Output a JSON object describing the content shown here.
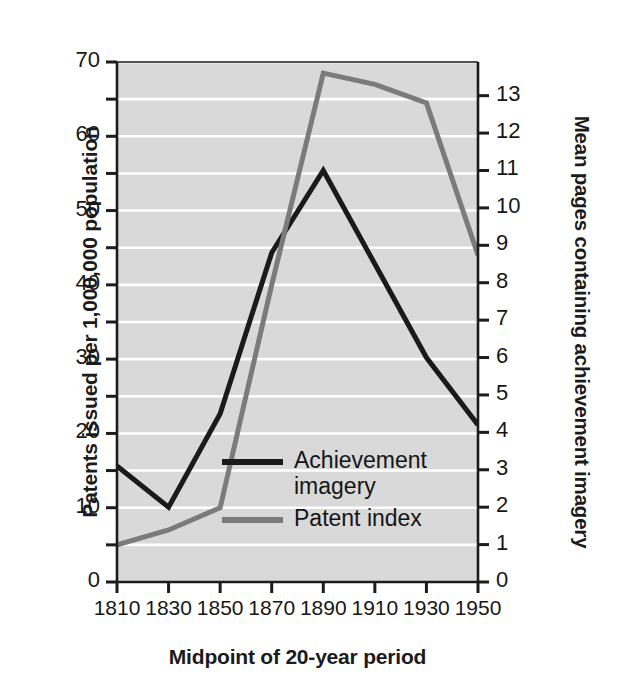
{
  "chart_data": {
    "type": "line",
    "title": "",
    "subtitle": "",
    "xlabel": "Midpoint of 20-year period",
    "ylabel": "Patents issued per 1,000,000 population",
    "y2label": "Mean pages containing achievement imagery",
    "grid": true,
    "grid_orientation": "horizontal",
    "legend_position": "inside-center-lower",
    "plot_background": "#d9d9d9",
    "gridline_color": "#ffffff",
    "x": [
      1810,
      1830,
      1850,
      1870,
      1890,
      1910,
      1930,
      1950
    ],
    "xtick_labels": [
      "1810",
      "1830",
      "1850",
      "1870",
      "1890",
      "1910",
      "1930",
      "1950"
    ],
    "xlim": [
      1810,
      1950
    ],
    "ylim": [
      0,
      70
    ],
    "ytick_labels": [
      "0",
      "10",
      "20",
      "30",
      "40",
      "50",
      "60",
      "70"
    ],
    "ytick_values": [
      0,
      10,
      20,
      30,
      40,
      50,
      60,
      70
    ],
    "yminor_tick_values": [
      5,
      15,
      25,
      35,
      45,
      55,
      65
    ],
    "y2lim": [
      0,
      13.9
    ],
    "y2tick_labels": [
      "0",
      "1",
      "2",
      "3",
      "4",
      "5",
      "6",
      "7",
      "8",
      "9",
      "10",
      "11",
      "12",
      "13"
    ],
    "y2tick_values": [
      0,
      1,
      2,
      3,
      4,
      5,
      6,
      7,
      8,
      9,
      10,
      11,
      12,
      13
    ],
    "series": [
      {
        "name": "Achievement imagery",
        "axis": "right",
        "color": "#1a1a1a",
        "line_width": 5,
        "values": [
          3.1,
          2.0,
          4.5,
          8.8,
          11.0,
          8.5,
          6.0,
          4.2
        ]
      },
      {
        "name": "Patent index",
        "axis": "left",
        "color": "#7b7b7b",
        "line_width": 5,
        "values": [
          5.0,
          7.0,
          10.0,
          40.0,
          68.5,
          67.0,
          64.5,
          44.0
        ]
      }
    ],
    "legend": [
      {
        "label_line1": "Achievement",
        "label_line2": "imagery",
        "color": "#1a1a1a"
      },
      {
        "label_line1": "Patent index",
        "label_line2": "",
        "color": "#7b7b7b"
      }
    ]
  },
  "axes": {
    "left_title": "Patents issued per 1,000,000 population",
    "right_title": "Mean pages containing achievement imagery",
    "bottom_title": "Midpoint of 20-year period"
  }
}
